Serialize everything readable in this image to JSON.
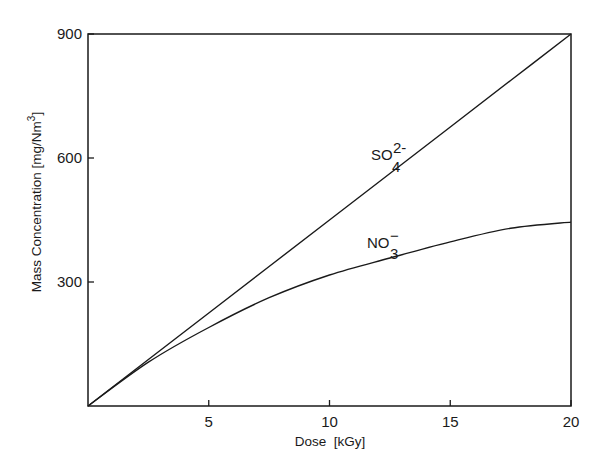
{
  "chart_data": {
    "type": "line",
    "title": "",
    "xlabel": "Dose  [kGy]",
    "ylabel": "Mass Concentration  [mg/Nm³]",
    "xlim": [
      0,
      20
    ],
    "ylim": [
      0,
      900
    ],
    "x_ticks": [
      5,
      10,
      15,
      20
    ],
    "y_ticks": [
      300,
      600,
      900
    ],
    "grid": false,
    "legend": "none (inline labels)",
    "x": [
      0,
      2.5,
      5,
      7.5,
      10,
      12.5,
      15,
      17.5,
      20
    ],
    "series": [
      {
        "name": "SO4 2-",
        "label_main": "SO",
        "label_sub": "4",
        "label_sup": "2-",
        "values": [
          0,
          112.5,
          225,
          337.5,
          450,
          562.5,
          675,
          787.5,
          900
        ]
      },
      {
        "name": "NO3 -",
        "label_main": "NO",
        "label_sub": "3",
        "label_sup": "−",
        "values": [
          0,
          106,
          190,
          262,
          317,
          358,
          397,
          430,
          445
        ]
      }
    ]
  },
  "axes": {
    "x_tick_labels": [
      "5",
      "10",
      "15",
      "20"
    ],
    "y_tick_labels": [
      "300",
      "600",
      "900"
    ],
    "x_title": "Dose  [kGy]",
    "y_title_main": "Mass Concentration  [mg/Nm",
    "y_title_sup": "3",
    "y_title_end": "]"
  }
}
